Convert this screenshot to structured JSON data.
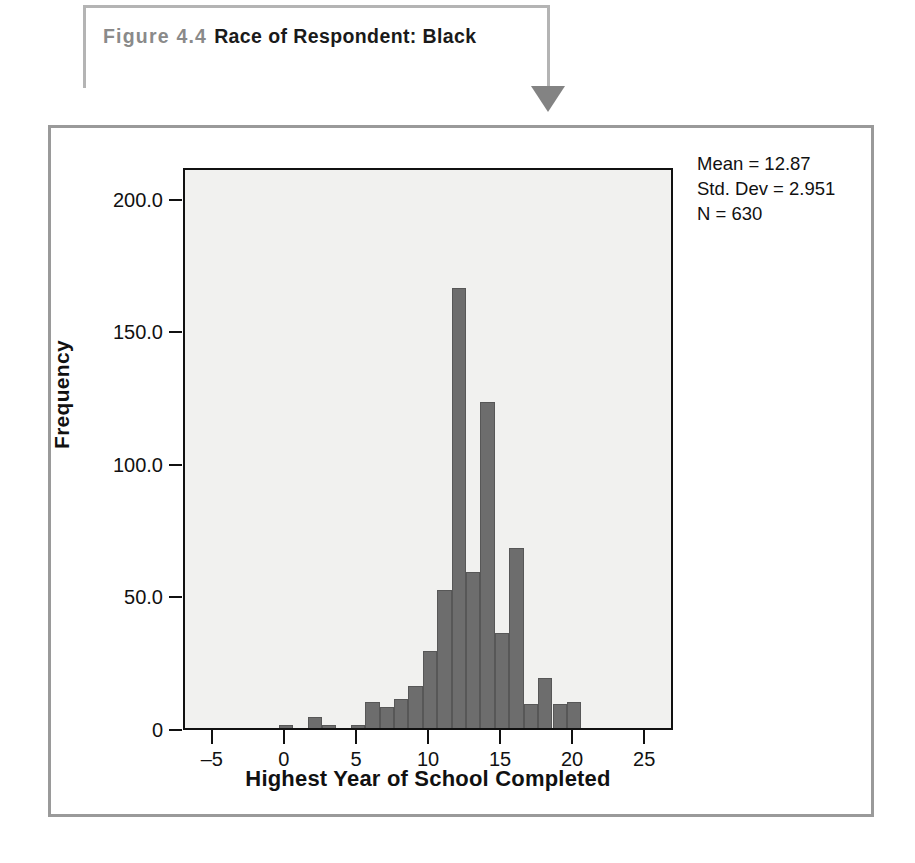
{
  "callout": {
    "figure_number": "Figure 4.4",
    "caption": "Race of Respondent: Black",
    "arrow_icon": "down-triangle-arrow-icon",
    "border_color": "#b4b4b4",
    "arrow_color": "#838383"
  },
  "figure": {
    "frame_color": "#9a9a9a",
    "background": "#ffffff"
  },
  "chart_data": {
    "type": "bar",
    "title": "Race of Respondent: Black",
    "xlabel": "Highest Year of School Completed",
    "ylabel": "Frequency",
    "xlim": [
      -7,
      27
    ],
    "ylim": [
      0,
      212
    ],
    "grid": false,
    "legend": null,
    "bar_color": "#6d6d6d",
    "plot_background": "#f1f1ef",
    "x_ticks": [
      -5,
      0,
      5,
      10,
      15,
      20,
      25
    ],
    "x_tick_labels": [
      "–5",
      "0",
      "5",
      "10",
      "15",
      "20",
      "25"
    ],
    "y_ticks": [
      0,
      50,
      100,
      150,
      200
    ],
    "y_tick_labels": [
      "0",
      "50.0",
      "100.0",
      "150.0",
      "200.0"
    ],
    "categories": [
      0,
      1,
      2,
      3,
      4,
      5,
      6,
      7,
      8,
      9,
      10,
      11,
      12,
      13,
      14,
      15,
      16,
      17,
      18,
      19,
      20
    ],
    "values": [
      1,
      0,
      4,
      1,
      0,
      1,
      10,
      8,
      11,
      16,
      29,
      52,
      166,
      59,
      123,
      36,
      68,
      9,
      19,
      9,
      10
    ],
    "annotations": [
      "Mean = 12.87",
      "Std. Dev = 2.951",
      "N = 630"
    ]
  },
  "stats": {
    "mean_label": "Mean = 12.87",
    "std_dev_label": "Std. Dev = 2.951",
    "n_label": "N = 630"
  }
}
